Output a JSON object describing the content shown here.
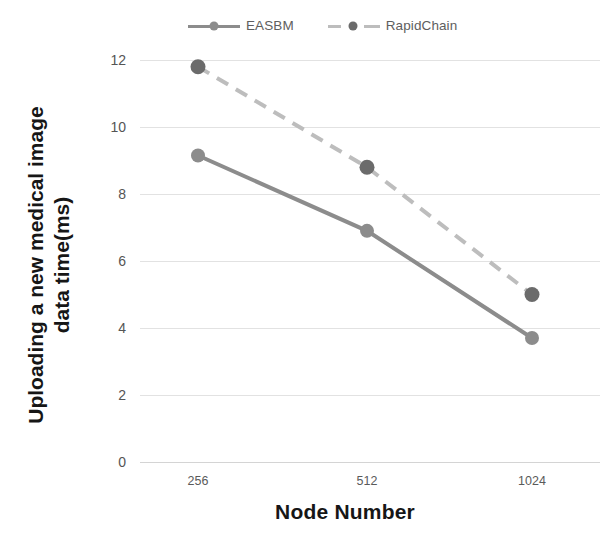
{
  "chart_data": {
    "type": "line",
    "title": "",
    "xlabel": "Node Number",
    "ylabel": "Uploading a new medical image data time(ms)",
    "ylabel_lines": [
      "Uploading a new medical image",
      "data time(ms)"
    ],
    "categories": [
      "256",
      "512",
      "1024"
    ],
    "x": [
      256,
      512,
      1024
    ],
    "series": [
      {
        "name": "EASBM",
        "values": [
          9.15,
          6.9,
          3.7
        ],
        "style": "solid",
        "color": "#8c8c8c",
        "marker": "circle"
      },
      {
        "name": "RapidChain",
        "values": [
          11.8,
          8.8,
          5.0
        ],
        "style": "dashed",
        "color": "#bdbdbd",
        "marker_color": "#6b6b6b",
        "marker": "circle"
      }
    ],
    "ylim": [
      0,
      12
    ],
    "yticks": [
      0,
      2,
      4,
      6,
      8,
      10,
      12
    ],
    "ytick_labels": [
      "0",
      "2",
      "4",
      "6",
      "8",
      "10",
      "12"
    ],
    "grid": true,
    "grid_axis": "y",
    "legend_position": "top-center",
    "background": "#ffffff",
    "grid_color": "#e2e2e2"
  },
  "legend": {
    "entries": [
      {
        "label": "EASBM"
      },
      {
        "label": "RapidChain"
      }
    ]
  },
  "axes": {
    "x_title": "Node Number",
    "y_title_line1": "Uploading a new medical image",
    "y_title_line2": "data time(ms)"
  }
}
